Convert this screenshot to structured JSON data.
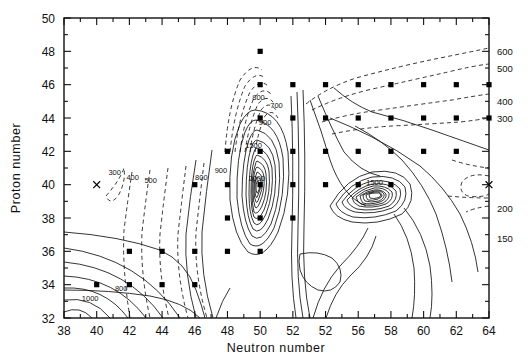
{
  "figure": {
    "title": "",
    "background": "#ffffff",
    "line_color": "#111111",
    "marker_color": "#000000"
  },
  "axes": {
    "x": {
      "label": "Neutron number",
      "min": 38,
      "max": 64,
      "tick_values": [
        38,
        40,
        42,
        44,
        46,
        48,
        50,
        52,
        54,
        56,
        58,
        60,
        62,
        64
      ],
      "tick_labels": [
        "38",
        "40",
        "42",
        "44",
        "46",
        "48",
        "50",
        "52",
        "52",
        "56",
        "58",
        "60",
        "62",
        "64"
      ],
      "minor_tick_step": 1
    },
    "y": {
      "label": "Proton number",
      "min": 32,
      "max": 50,
      "tick_values": [
        32,
        34,
        36,
        38,
        40,
        42,
        44,
        46,
        48,
        50
      ],
      "tick_labels": [
        "32",
        "34",
        "36",
        "38",
        "40",
        "42",
        "44",
        "46",
        "48",
        "50"
      ],
      "minor_tick_step": 1
    }
  },
  "chart_data": {
    "type": "contour",
    "title": "",
    "xlabel": "Neutron number",
    "ylabel": "Proton number",
    "xlim": [
      38,
      64
    ],
    "ylim": [
      32,
      50
    ],
    "grid": false,
    "legend": "none",
    "z_description": "contour level value",
    "contour_levels": [
      150,
      200,
      300,
      400,
      500,
      600,
      700,
      800,
      900,
      1000,
      1500,
      2000
    ],
    "line_styles": {
      "solid": "higher / reference levels",
      "dashed": "lower levels"
    },
    "inline_labels": [
      {
        "text": "300",
        "x": 41.1,
        "y": 40.6
      },
      {
        "text": "400",
        "x": 42.2,
        "y": 40.3
      },
      {
        "text": "500",
        "x": 43.3,
        "y": 40.1
      },
      {
        "text": "800",
        "x": 46.4,
        "y": 40.3
      },
      {
        "text": "900",
        "x": 47.6,
        "y": 40.7
      },
      {
        "text": "800",
        "x": 49.9,
        "y": 45.1
      },
      {
        "text": "700",
        "x": 51.0,
        "y": 44.6
      },
      {
        "text": "900",
        "x": 50.3,
        "y": 43.6
      },
      {
        "text": "1500",
        "x": 49.6,
        "y": 42.2
      },
      {
        "text": "2000",
        "x": 49.8,
        "y": 40.2
      },
      {
        "text": "1500",
        "x": 57.0,
        "y": 40.0
      },
      {
        "text": "1000",
        "x": 39.6,
        "y": 33.0
      },
      {
        "text": "800",
        "x": 41.5,
        "y": 33.6
      }
    ],
    "edge_labels": [
      {
        "text": "600",
        "y": 48.0
      },
      {
        "text": "500",
        "y": 47.0
      },
      {
        "text": "400",
        "y": 45.0
      },
      {
        "text": "300",
        "y": 44.0
      },
      {
        "text": "200",
        "y": 38.6
      },
      {
        "text": "150",
        "y": 36.8
      }
    ],
    "markers": {
      "square": {
        "symbol": "filled-square",
        "points": [
          [
            50,
            46
          ],
          [
            52,
            46
          ],
          [
            54,
            46
          ],
          [
            56,
            46
          ],
          [
            58,
            46
          ],
          [
            60,
            46
          ],
          [
            62,
            46
          ],
          [
            64,
            46
          ],
          [
            50,
            44
          ],
          [
            52,
            44
          ],
          [
            54,
            44
          ],
          [
            56,
            44
          ],
          [
            58,
            44
          ],
          [
            60,
            44
          ],
          [
            62,
            44
          ],
          [
            64,
            44
          ],
          [
            50,
            42
          ],
          [
            52,
            42
          ],
          [
            54,
            42
          ],
          [
            56,
            42
          ],
          [
            58,
            42
          ],
          [
            60,
            42
          ],
          [
            62,
            42
          ],
          [
            48,
            42
          ],
          [
            48,
            40
          ],
          [
            50,
            40
          ],
          [
            52,
            40
          ],
          [
            54,
            40
          ],
          [
            56,
            40
          ],
          [
            58,
            40
          ],
          [
            46,
            40
          ],
          [
            48,
            38
          ],
          [
            50,
            38
          ],
          [
            52,
            38
          ],
          [
            42,
            36
          ],
          [
            44,
            36
          ],
          [
            46,
            36
          ],
          [
            48,
            36
          ],
          [
            50,
            36
          ],
          [
            40,
            34
          ],
          [
            42,
            34
          ],
          [
            44,
            34
          ],
          [
            46,
            34
          ],
          [
            50,
            48
          ]
        ]
      },
      "cross": {
        "symbol": "x-mark",
        "points": [
          [
            40,
            40
          ],
          [
            64,
            40
          ]
        ]
      }
    }
  }
}
